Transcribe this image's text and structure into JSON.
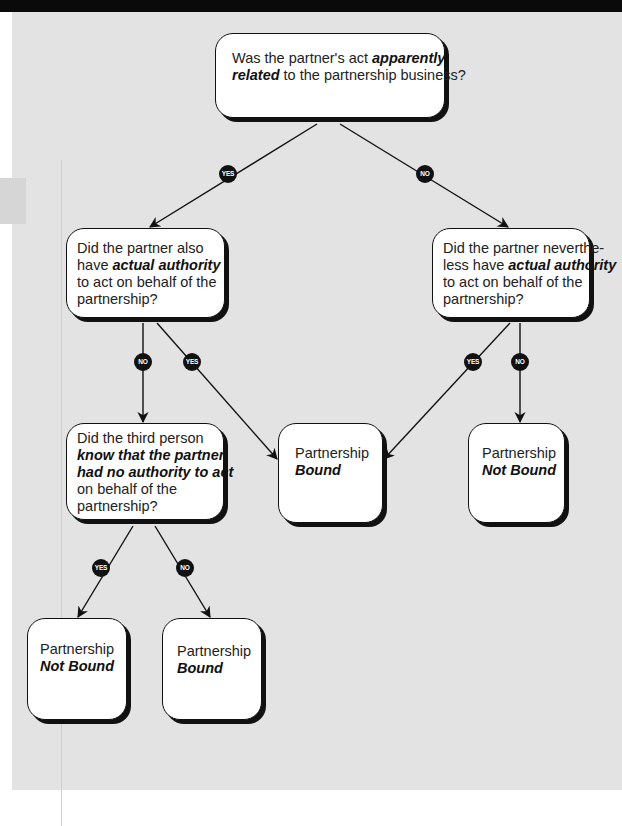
{
  "diagram": {
    "type": "decision-flowchart",
    "colors": {
      "background": "#e3e3e3",
      "node_fill": "#ffffff",
      "stroke": "#111111",
      "badge_fill": "#111111",
      "badge_text": "#ffffff"
    },
    "nodes": {
      "q_apparent": {
        "pre": "Was the partner's act ",
        "em": "apparently related",
        "em_line1": "apparently",
        "em_line2": "related",
        "post": " to the partnership business?"
      },
      "q_actual_yes": {
        "line1": "Did the partner also",
        "pre": "have ",
        "em": "actual authority",
        "line3": "to act on behalf of the",
        "line4": "partnership?"
      },
      "q_actual_no": {
        "line1": "Did the partner neverthe-",
        "pre": "less have ",
        "em": "actual authority",
        "line3": "to act on behalf of the",
        "line4": "partnership?"
      },
      "q_knowledge": {
        "line1": "Did the third person",
        "em1": "know that the partner",
        "em2": "had no authority to act",
        "line4": "on behalf of the",
        "line5": "partnership?"
      },
      "outcome_bound_center": {
        "line1": "Partnership",
        "em": "Bound"
      },
      "outcome_not_bound_right": {
        "line1": "Partnership",
        "em": "Not Bound"
      },
      "outcome_not_bound_bottom": {
        "line1": "Partnership",
        "em": "Not Bound"
      },
      "outcome_bound_bottom": {
        "line1": "Partnership",
        "em": "Bound"
      }
    },
    "edges": [
      {
        "from": "q_apparent",
        "to": "q_actual_yes",
        "label": "YES"
      },
      {
        "from": "q_apparent",
        "to": "q_actual_no",
        "label": "NO"
      },
      {
        "from": "q_actual_yes",
        "to": "q_knowledge",
        "label": "NO"
      },
      {
        "from": "q_actual_yes",
        "to": "outcome_bound_center",
        "label": "YES"
      },
      {
        "from": "q_actual_no",
        "to": "outcome_bound_center",
        "label": "YES"
      },
      {
        "from": "q_actual_no",
        "to": "outcome_not_bound_right",
        "label": "NO"
      },
      {
        "from": "q_knowledge",
        "to": "outcome_not_bound_bottom",
        "label": "YES"
      },
      {
        "from": "q_knowledge",
        "to": "outcome_bound_bottom",
        "label": "NO"
      }
    ]
  }
}
